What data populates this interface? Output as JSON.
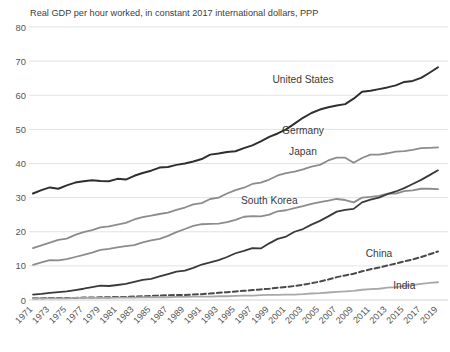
{
  "chart_data": {
    "type": "line",
    "title": "Real GDP per hour worked, in constant 2017 international dollars, PPP",
    "xlabel": "",
    "ylabel": "",
    "ylim": [
      0,
      80
    ],
    "yticks": [
      0,
      10,
      20,
      30,
      40,
      50,
      60,
      70,
      80
    ],
    "xlim": [
      1971,
      2019
    ],
    "grid": true,
    "legend_position": "inline-labels",
    "x": [
      1971,
      1972,
      1973,
      1974,
      1975,
      1976,
      1977,
      1978,
      1979,
      1980,
      1981,
      1982,
      1983,
      1984,
      1985,
      1986,
      1987,
      1988,
      1989,
      1990,
      1991,
      1992,
      1993,
      1994,
      1995,
      1996,
      1997,
      1998,
      1999,
      2000,
      2001,
      2002,
      2003,
      2004,
      2005,
      2006,
      2007,
      2008,
      2009,
      2010,
      2011,
      2012,
      2013,
      2014,
      2015,
      2016,
      2017,
      2018,
      2019
    ],
    "xtick_labels": [
      "1971",
      "1973",
      "1975",
      "1977",
      "1979",
      "1981",
      "1983",
      "1985",
      "1987",
      "1989",
      "1991",
      "1993",
      "1995",
      "1997",
      "1999",
      "2001",
      "2003",
      "2005",
      "2007",
      "2009",
      "2011",
      "2013",
      "2015",
      "2017",
      "2019"
    ],
    "series": [
      {
        "name": "United States",
        "color": "#2f2f2f",
        "width": 2.0,
        "dash": "none",
        "label_x": 2003,
        "label_y": 63.5,
        "values": [
          31.2,
          32.2,
          33.0,
          32.6,
          33.6,
          34.4,
          34.8,
          35.1,
          34.9,
          34.8,
          35.5,
          35.3,
          36.4,
          37.2,
          37.9,
          38.8,
          39.0,
          39.6,
          40.0,
          40.6,
          41.3,
          42.6,
          42.9,
          43.4,
          43.6,
          44.5,
          45.3,
          46.5,
          47.8,
          48.8,
          50.0,
          51.7,
          53.4,
          54.8,
          55.8,
          56.5,
          57.0,
          57.4,
          59.0,
          61.0,
          61.3,
          61.8,
          62.3,
          62.9,
          63.9,
          64.2,
          65.1,
          66.6,
          68.2
        ]
      },
      {
        "name": "Germany",
        "color": "#8c8c8c",
        "width": 1.8,
        "dash": "none",
        "label_x": 2003,
        "label_y": 48.5,
        "values": [
          15.2,
          16.0,
          16.8,
          17.6,
          18.0,
          19.1,
          19.9,
          20.5,
          21.3,
          21.6,
          22.1,
          22.6,
          23.6,
          24.3,
          24.7,
          25.2,
          25.6,
          26.4,
          27.1,
          28.0,
          28.4,
          29.6,
          30.0,
          31.2,
          32.2,
          32.9,
          34.0,
          34.4,
          35.3,
          36.5,
          37.2,
          37.6,
          38.3,
          39.1,
          39.6,
          40.9,
          41.7,
          41.7,
          40.2,
          41.6,
          42.6,
          42.6,
          43.0,
          43.5,
          43.6,
          44.0,
          44.5,
          44.6,
          44.7
        ]
      },
      {
        "name": "Japan",
        "color": "#8c8c8c",
        "width": 1.8,
        "dash": "none",
        "label_x": 2003,
        "label_y": 42.5,
        "values": [
          10.3,
          11.0,
          11.7,
          11.6,
          12.0,
          12.6,
          13.2,
          13.9,
          14.7,
          15.0,
          15.4,
          15.8,
          16.1,
          16.9,
          17.5,
          17.9,
          18.8,
          19.9,
          20.8,
          21.7,
          22.2,
          22.3,
          22.4,
          22.8,
          23.5,
          24.4,
          24.6,
          24.5,
          25.0,
          26.0,
          26.3,
          26.9,
          27.5,
          28.2,
          28.7,
          29.1,
          29.6,
          29.3,
          28.6,
          30.0,
          30.2,
          30.5,
          31.2,
          31.2,
          31.9,
          32.1,
          32.6,
          32.6,
          32.5
        ]
      },
      {
        "name": "South Korea",
        "color": "#3a3a3a",
        "width": 1.8,
        "dash": "none",
        "label_x": 1999,
        "label_y": 28.0,
        "values": [
          1.6,
          1.8,
          2.1,
          2.3,
          2.5,
          2.9,
          3.3,
          3.8,
          4.2,
          4.1,
          4.4,
          4.7,
          5.3,
          5.9,
          6.2,
          6.9,
          7.6,
          8.3,
          8.6,
          9.4,
          10.4,
          11.0,
          11.7,
          12.6,
          13.7,
          14.4,
          15.2,
          15.1,
          16.6,
          17.9,
          18.6,
          20.0,
          20.8,
          22.1,
          23.2,
          24.5,
          25.9,
          26.4,
          26.7,
          28.6,
          29.4,
          30.0,
          31.0,
          31.8,
          32.8,
          34.0,
          35.2,
          36.6,
          38.0
        ]
      },
      {
        "name": "China",
        "color": "#4a4a4a",
        "width": 2.0,
        "dash": "5,3",
        "label_x": 2012,
        "label_y": 12.5,
        "values": [
          0.5,
          0.5,
          0.6,
          0.6,
          0.6,
          0.6,
          0.7,
          0.7,
          0.8,
          0.8,
          0.9,
          0.9,
          1.0,
          1.1,
          1.2,
          1.3,
          1.4,
          1.5,
          1.5,
          1.6,
          1.7,
          1.9,
          2.1,
          2.3,
          2.5,
          2.7,
          2.9,
          3.1,
          3.3,
          3.6,
          3.8,
          4.1,
          4.5,
          4.9,
          5.4,
          6.0,
          6.7,
          7.2,
          7.7,
          8.4,
          9.0,
          9.5,
          10.1,
          10.7,
          11.3,
          11.9,
          12.6,
          13.4,
          14.2
        ]
      },
      {
        "name": "India",
        "color": "#a8a8a8",
        "width": 1.8,
        "dash": "none",
        "label_x": 2015,
        "label_y": 3.2,
        "values": [
          0.5,
          0.5,
          0.5,
          0.5,
          0.5,
          0.6,
          0.6,
          0.6,
          0.6,
          0.6,
          0.7,
          0.7,
          0.7,
          0.8,
          0.8,
          0.8,
          0.8,
          0.9,
          0.9,
          1.0,
          1.0,
          1.0,
          1.1,
          1.1,
          1.2,
          1.3,
          1.3,
          1.4,
          1.5,
          1.5,
          1.6,
          1.6,
          1.7,
          1.9,
          2.0,
          2.2,
          2.4,
          2.5,
          2.7,
          3.0,
          3.2,
          3.3,
          3.6,
          3.8,
          4.1,
          4.4,
          4.7,
          5.0,
          5.2
        ]
      }
    ]
  }
}
